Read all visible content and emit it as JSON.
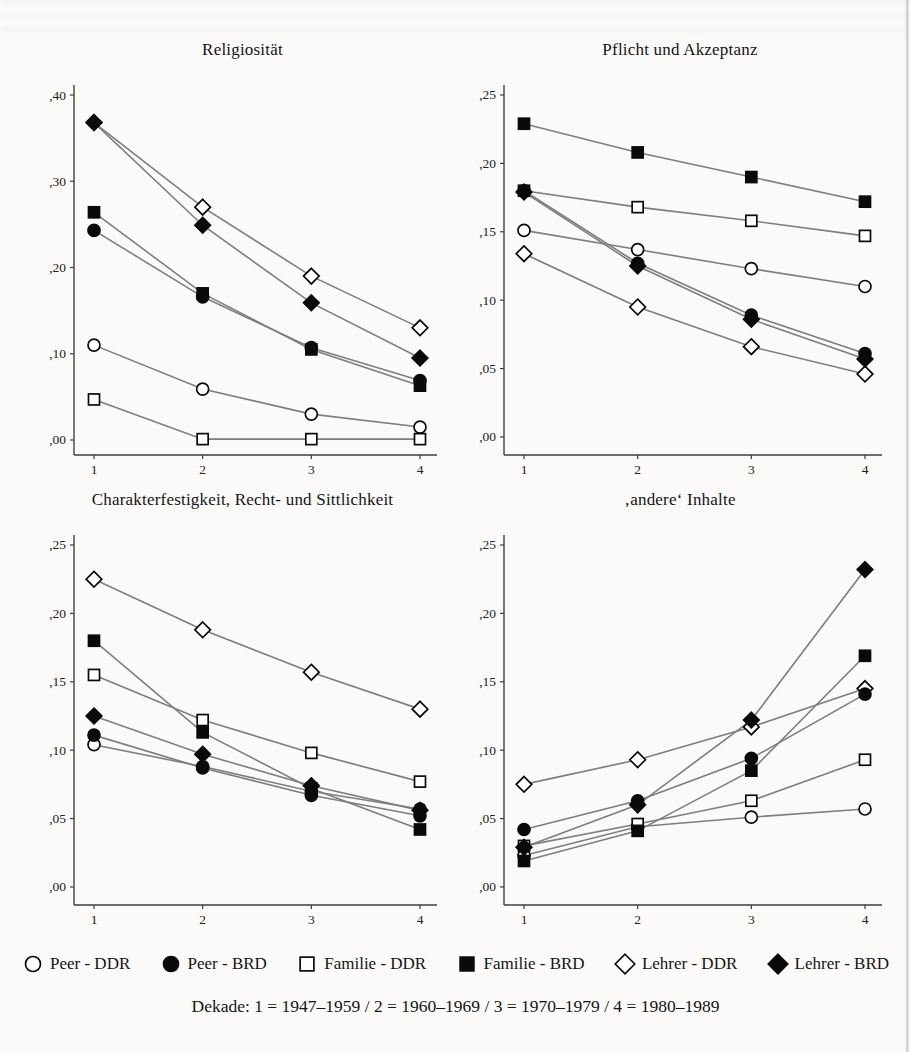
{
  "page": {
    "caption": "Dekade: 1 = 1947–1959 / 2 = 1960–1969 / 3 = 1970–1979 / 4 = 1980–1989"
  },
  "colors": {
    "line": "#7e7e7e",
    "axis": "#3f3f3f",
    "marker_stroke": "#0a0a0a",
    "marker_filled_fill": "#0a0a0a",
    "marker_open_fill": "#ffffff",
    "tick_text": "#222222"
  },
  "legend": {
    "items": [
      {
        "label": "Peer - DDR",
        "marker": "circle",
        "fill": "open"
      },
      {
        "label": "Peer - BRD",
        "marker": "circle",
        "fill": "filled"
      },
      {
        "label": "Familie - DDR",
        "marker": "square",
        "fill": "open"
      },
      {
        "label": "Familie - BRD",
        "marker": "square",
        "fill": "filled"
      },
      {
        "label": "Lehrer - DDR",
        "marker": "diamond",
        "fill": "open"
      },
      {
        "label": "Lehrer - BRD",
        "marker": "diamond",
        "fill": "filled"
      }
    ]
  },
  "chart_data": [
    {
      "type": "line",
      "title": "Religiosität",
      "x_ticklabels": [
        "1",
        "2",
        "3",
        "4"
      ],
      "y_ticks": [
        0.0,
        0.1,
        0.2,
        0.3,
        0.4
      ],
      "y_ticklabels": [
        ",00",
        ",10",
        ",20",
        ",30",
        ",40"
      ],
      "ylim": [
        -0.0174,
        0.4116
      ],
      "grid": false,
      "series": [
        {
          "name": "Peer - DDR",
          "marker": "circle",
          "fill": "open",
          "values": [
            0.11,
            0.059,
            0.03,
            0.015
          ]
        },
        {
          "name": "Familie - DDR",
          "marker": "square",
          "fill": "open",
          "values": [
            0.047,
            0.001,
            0.001,
            0.001
          ]
        },
        {
          "name": "Lehrer - DDR",
          "marker": "diamond",
          "fill": "open",
          "values": [
            0.368,
            0.27,
            0.19,
            0.13
          ]
        },
        {
          "name": "Peer - BRD",
          "marker": "circle",
          "fill": "filled",
          "values": [
            0.243,
            0.166,
            0.107,
            0.069
          ]
        },
        {
          "name": "Familie - BRD",
          "marker": "square",
          "fill": "filled",
          "values": [
            0.264,
            0.17,
            0.105,
            0.063
          ]
        },
        {
          "name": "Lehrer - BRD",
          "marker": "diamond",
          "fill": "filled",
          "values": [
            0.368,
            0.249,
            0.159,
            0.095
          ]
        }
      ]
    },
    {
      "type": "line",
      "title": "Pflicht und Akzeptanz",
      "x_ticklabels": [
        "1",
        "2",
        "3",
        "4"
      ],
      "y_ticks": [
        0.0,
        0.05,
        0.1,
        0.15,
        0.2,
        0.25
      ],
      "y_ticklabels": [
        ",00",
        ",05",
        ",10",
        ",15",
        ",20",
        ",25"
      ],
      "ylim": [
        -0.0132,
        0.2573
      ],
      "grid": false,
      "series": [
        {
          "name": "Peer - DDR",
          "marker": "circle",
          "fill": "open",
          "values": [
            0.151,
            0.137,
            0.123,
            0.11
          ]
        },
        {
          "name": "Familie - DDR",
          "marker": "square",
          "fill": "open",
          "values": [
            0.18,
            0.168,
            0.158,
            0.147
          ]
        },
        {
          "name": "Lehrer - DDR",
          "marker": "diamond",
          "fill": "open",
          "values": [
            0.134,
            0.095,
            0.066,
            0.046
          ]
        },
        {
          "name": "Peer - BRD",
          "marker": "circle",
          "fill": "filled",
          "values": [
            0.18,
            0.127,
            0.089,
            0.061
          ]
        },
        {
          "name": "Familie - BRD",
          "marker": "square",
          "fill": "filled",
          "values": [
            0.229,
            0.208,
            0.19,
            0.172
          ]
        },
        {
          "name": "Lehrer - BRD",
          "marker": "diamond",
          "fill": "filled",
          "values": [
            0.179,
            0.125,
            0.086,
            0.057
          ]
        }
      ]
    },
    {
      "type": "line",
      "title": "Charakterfestigkeit, Recht- und Sittlichkeit",
      "x_ticklabels": [
        "1",
        "2",
        "3",
        "4"
      ],
      "y_ticks": [
        0.0,
        0.05,
        0.1,
        0.15,
        0.2,
        0.25
      ],
      "y_ticklabels": [
        ",00",
        ",05",
        ",10",
        ",15",
        ",20",
        ",25"
      ],
      "ylim": [
        -0.0132,
        0.2573
      ],
      "grid": false,
      "series": [
        {
          "name": "Peer - DDR",
          "marker": "circle",
          "fill": "open",
          "values": [
            0.104,
            0.088,
            0.07,
            0.057
          ]
        },
        {
          "name": "Familie - DDR",
          "marker": "square",
          "fill": "open",
          "values": [
            0.155,
            0.122,
            0.098,
            0.077
          ]
        },
        {
          "name": "Lehrer - DDR",
          "marker": "diamond",
          "fill": "open",
          "values": [
            0.225,
            0.188,
            0.157,
            0.13
          ]
        },
        {
          "name": "Peer - BRD",
          "marker": "circle",
          "fill": "filled",
          "values": [
            0.111,
            0.087,
            0.067,
            0.052
          ]
        },
        {
          "name": "Familie - BRD",
          "marker": "square",
          "fill": "filled",
          "values": [
            0.18,
            0.113,
            0.072,
            0.042
          ]
        },
        {
          "name": "Lehrer - BRD",
          "marker": "diamond",
          "fill": "filled",
          "values": [
            0.125,
            0.097,
            0.074,
            0.056
          ]
        }
      ]
    },
    {
      "type": "line",
      "title": "‚andere‘ Inhalte",
      "x_ticklabels": [
        "1",
        "2",
        "3",
        "4"
      ],
      "y_ticks": [
        0.0,
        0.05,
        0.1,
        0.15,
        0.2,
        0.25
      ],
      "y_ticklabels": [
        ",00",
        ",05",
        ",10",
        ",15",
        ",20",
        ",25"
      ],
      "ylim": [
        -0.0132,
        0.2573
      ],
      "grid": false,
      "series": [
        {
          "name": "Peer - DDR",
          "marker": "circle",
          "fill": "open",
          "values": [
            0.023,
            0.044,
            0.051,
            0.057
          ]
        },
        {
          "name": "Familie - DDR",
          "marker": "square",
          "fill": "open",
          "values": [
            0.03,
            0.046,
            0.063,
            0.093
          ]
        },
        {
          "name": "Lehrer - DDR",
          "marker": "diamond",
          "fill": "open",
          "values": [
            0.075,
            0.093,
            0.117,
            0.145
          ]
        },
        {
          "name": "Peer - BRD",
          "marker": "circle",
          "fill": "filled",
          "values": [
            0.042,
            0.063,
            0.094,
            0.141
          ]
        },
        {
          "name": "Familie - BRD",
          "marker": "square",
          "fill": "filled",
          "values": [
            0.019,
            0.041,
            0.085,
            0.169
          ]
        },
        {
          "name": "Lehrer - BRD",
          "marker": "diamond",
          "fill": "filled",
          "values": [
            0.029,
            0.06,
            0.122,
            0.232
          ]
        }
      ]
    }
  ]
}
